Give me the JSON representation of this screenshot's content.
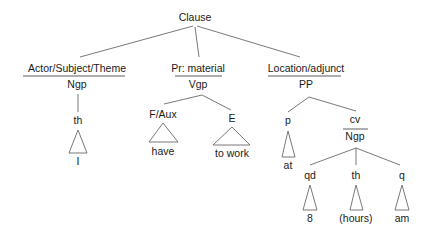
{
  "diagram": {
    "type": "systemic-functional-parse-tree",
    "root": {
      "label": "Clause"
    },
    "constituents": [
      {
        "function": "Actor/Subject/Theme",
        "class": "Ngp",
        "children": [
          {
            "label": "th",
            "leaf": "I"
          }
        ]
      },
      {
        "function": "Pr: material",
        "class": "Vgp",
        "children": [
          {
            "label": "F/Aux",
            "leaf": "have"
          },
          {
            "label": "E",
            "leaf": "to work"
          }
        ]
      },
      {
        "function": "Location/adjunct",
        "class": "PP",
        "children": [
          {
            "label": "p",
            "leaf": "at"
          },
          {
            "function": "cv",
            "class": "Ngp",
            "children": [
              {
                "label": "qd",
                "leaf": "8"
              },
              {
                "label": "th",
                "leaf": "(hours)"
              },
              {
                "label": "q",
                "leaf": "am"
              }
            ]
          }
        ]
      }
    ]
  }
}
